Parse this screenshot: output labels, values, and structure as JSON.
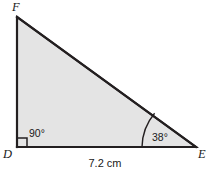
{
  "figure": {
    "type": "right-triangle-diagram",
    "background_color": "#ffffff",
    "fill_color": "#e4e4e4",
    "stroke_color": "#231f20",
    "stroke_width": 2,
    "vertices": [
      {
        "id": "F",
        "label": "F",
        "x": 17,
        "y": 17,
        "label_x": 12,
        "label_y": 11
      },
      {
        "id": "D",
        "label": "D",
        "x": 17,
        "y": 147,
        "label_x": 3,
        "label_y": 158
      },
      {
        "id": "E",
        "label": "E",
        "x": 196,
        "y": 147,
        "label_x": 198,
        "label_y": 158
      }
    ],
    "angles": [
      {
        "at": "D",
        "label": "90°",
        "marker": "right-angle-square",
        "label_x": 28,
        "label_y": 137
      },
      {
        "at": "E",
        "label": "38°",
        "marker": "arc",
        "label_x": 152,
        "label_y": 141
      }
    ],
    "side_labels": [
      {
        "side": "DE",
        "label": "7.2 cm",
        "label_x": 105,
        "label_y": 167,
        "anchor": "middle"
      }
    ]
  }
}
